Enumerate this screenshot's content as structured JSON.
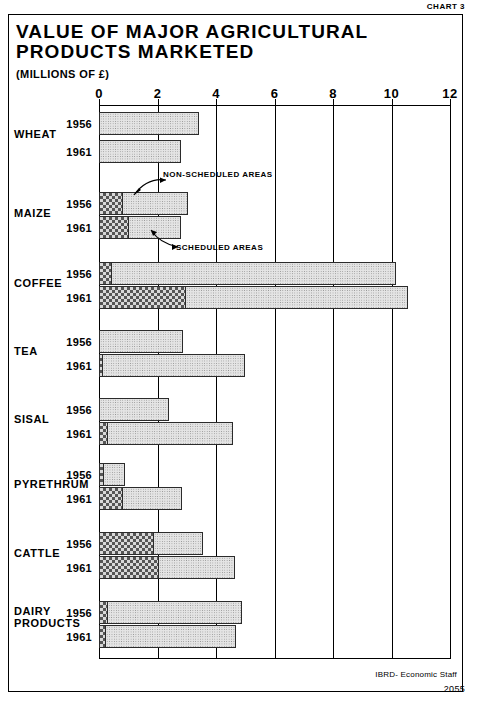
{
  "chart_label": "CHART 3",
  "title_line1": "VALUE OF MAJOR AGRICULTURAL",
  "title_line2": "PRODUCTS MARKETED",
  "subtitle": "(MILLIONS OF £)",
  "annotations": {
    "non_scheduled": "NON-SCHEDULED AREAS",
    "scheduled": "SCHEDULED AREAS"
  },
  "footer": {
    "source": "IBRD- Economic Staff",
    "number": "2055"
  },
  "chart_data": {
    "type": "bar",
    "orientation": "horizontal",
    "title": "VALUE OF MAJOR AGRICULTURAL PRODUCTS MARKETED",
    "subtitle": "(MILLIONS OF £)",
    "xlabel": "Millions of £",
    "ylabel": "",
    "xlim": [
      0,
      12.5
    ],
    "xticks": [
      0,
      2,
      4,
      6,
      8,
      10,
      12
    ],
    "xtick_labels": [
      "0",
      "2",
      "4",
      "6",
      "8",
      "10",
      "12"
    ],
    "grid": "vertical",
    "stacked": true,
    "legend": [
      "SCHEDULED AREAS",
      "NON-SCHEDULED AREAS"
    ],
    "legend_position": "inline-annotation",
    "series": [
      {
        "name": "SCHEDULED AREAS",
        "pattern": "cross-hatch",
        "color": "#6b6b6b"
      },
      {
        "name": "NON-SCHEDULED AREAS",
        "pattern": "stipple",
        "color": "#e4e4e4"
      }
    ],
    "categories": [
      {
        "name": "WHEAT",
        "bars": [
          {
            "year": "1956",
            "scheduled": 0.0,
            "non_scheduled": 3.42,
            "total": 3.42
          },
          {
            "year": "1961",
            "scheduled": 0.0,
            "non_scheduled": 2.8,
            "total": 2.8
          }
        ]
      },
      {
        "name": "MAIZE",
        "bars": [
          {
            "year": "1956",
            "scheduled": 0.8,
            "non_scheduled": 2.25,
            "total": 3.05
          },
          {
            "year": "1961",
            "scheduled": 1.0,
            "non_scheduled": 1.8,
            "total": 2.8
          }
        ]
      },
      {
        "name": "COFFEE",
        "bars": [
          {
            "year": "1956",
            "scheduled": 0.4,
            "non_scheduled": 9.75,
            "total": 10.15
          },
          {
            "year": "1961",
            "scheduled": 2.95,
            "non_scheduled": 7.6,
            "total": 10.55
          }
        ]
      },
      {
        "name": "TEA",
        "bars": [
          {
            "year": "1956",
            "scheduled": 0.0,
            "non_scheduled": 2.88,
            "total": 2.88
          },
          {
            "year": "1961",
            "scheduled": 0.1,
            "non_scheduled": 4.9,
            "total": 5.0
          }
        ]
      },
      {
        "name": "SISAL",
        "bars": [
          {
            "year": "1956",
            "scheduled": 0.0,
            "non_scheduled": 2.4,
            "total": 2.4
          },
          {
            "year": "1961",
            "scheduled": 0.28,
            "non_scheduled": 4.29,
            "total": 4.57
          }
        ]
      },
      {
        "name": "PYRETHRUM",
        "bars": [
          {
            "year": "1956",
            "scheduled": 0.15,
            "non_scheduled": 0.75,
            "total": 0.9
          },
          {
            "year": "1961",
            "scheduled": 0.8,
            "non_scheduled": 2.05,
            "total": 2.85
          }
        ]
      },
      {
        "name": "CATTLE",
        "bars": [
          {
            "year": "1956",
            "scheduled": 1.85,
            "non_scheduled": 1.7,
            "total": 3.55
          },
          {
            "year": "1961",
            "scheduled": 2.0,
            "non_scheduled": 2.65,
            "total": 4.65
          }
        ]
      },
      {
        "name": "DAIRY PRODUCTS",
        "bars": [
          {
            "year": "1956",
            "scheduled": 0.28,
            "non_scheduled": 4.62,
            "total": 4.9
          },
          {
            "year": "1961",
            "scheduled": 0.22,
            "non_scheduled": 4.48,
            "total": 4.7
          }
        ]
      }
    ]
  }
}
